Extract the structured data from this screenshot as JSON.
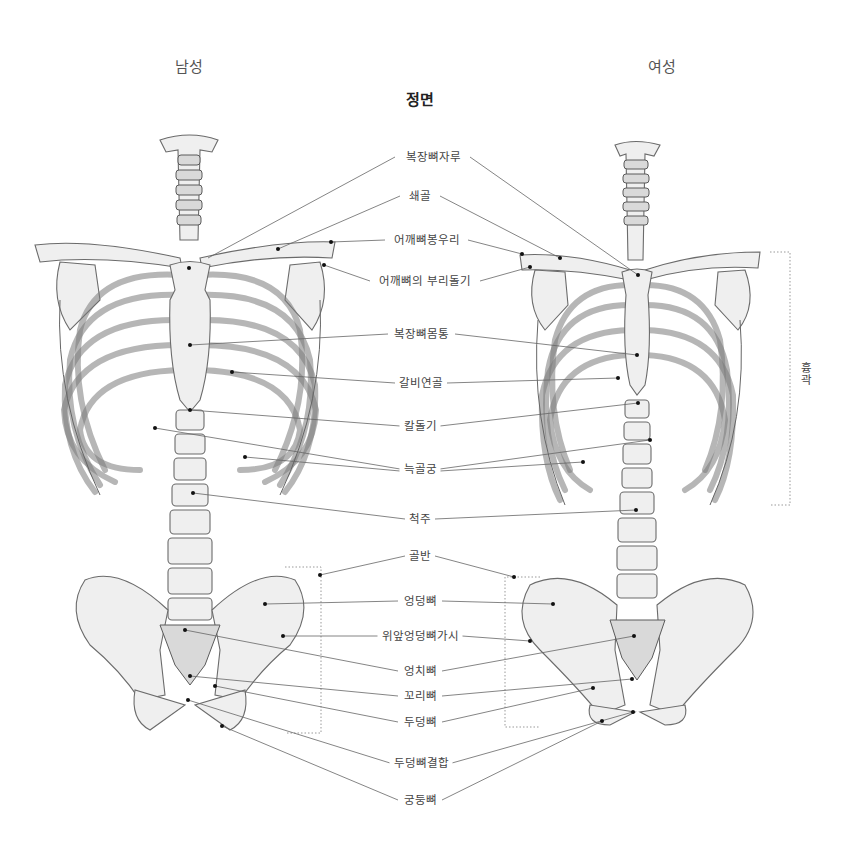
{
  "columns": {
    "male": "남성",
    "female": "여성"
  },
  "view_title": "정면",
  "labels": [
    {
      "id": "manubrium",
      "text": "복장뼈자루",
      "x": 433,
      "y": 157
    },
    {
      "id": "clavicle",
      "text": "쇄골",
      "x": 420,
      "y": 196
    },
    {
      "id": "acromion",
      "text": "어깨뼈봉우리",
      "x": 420,
      "y": 240
    },
    {
      "id": "coracoid",
      "text": "어깨뼈의 부리돌기",
      "x": 420,
      "y": 281
    },
    {
      "id": "sternum-body",
      "text": "복장뼈몸통",
      "x": 420,
      "y": 334
    },
    {
      "id": "costal-cartilage",
      "text": "갈비연골",
      "x": 420,
      "y": 383
    },
    {
      "id": "xiphoid",
      "text": "칼돌기",
      "x": 420,
      "y": 426
    },
    {
      "id": "costal-arch",
      "text": "늑골궁",
      "x": 420,
      "y": 469
    },
    {
      "id": "spine",
      "text": "척주",
      "x": 420,
      "y": 519
    },
    {
      "id": "pelvis",
      "text": "골반",
      "x": 420,
      "y": 556
    },
    {
      "id": "ilium",
      "text": "엉덩뼈",
      "x": 420,
      "y": 601
    },
    {
      "id": "asis",
      "text": "위앞엉덩뼈가시",
      "x": 420,
      "y": 636
    },
    {
      "id": "ischium",
      "text": "엉치뼈",
      "x": 420,
      "y": 671
    },
    {
      "id": "coccyx",
      "text": "꼬리뼈",
      "x": 420,
      "y": 696
    },
    {
      "id": "pubis",
      "text": "두덩뼈",
      "x": 420,
      "y": 722
    },
    {
      "id": "pubic-symphysis",
      "text": "두덩뼈결합",
      "x": 420,
      "y": 763
    },
    {
      "id": "sacrum",
      "text": "궁둥뼈",
      "x": 420,
      "y": 800
    }
  ],
  "side_label": {
    "text": "흉곽"
  },
  "colors": {
    "line": "#666666",
    "text": "#444444",
    "bone": "#efefef"
  }
}
